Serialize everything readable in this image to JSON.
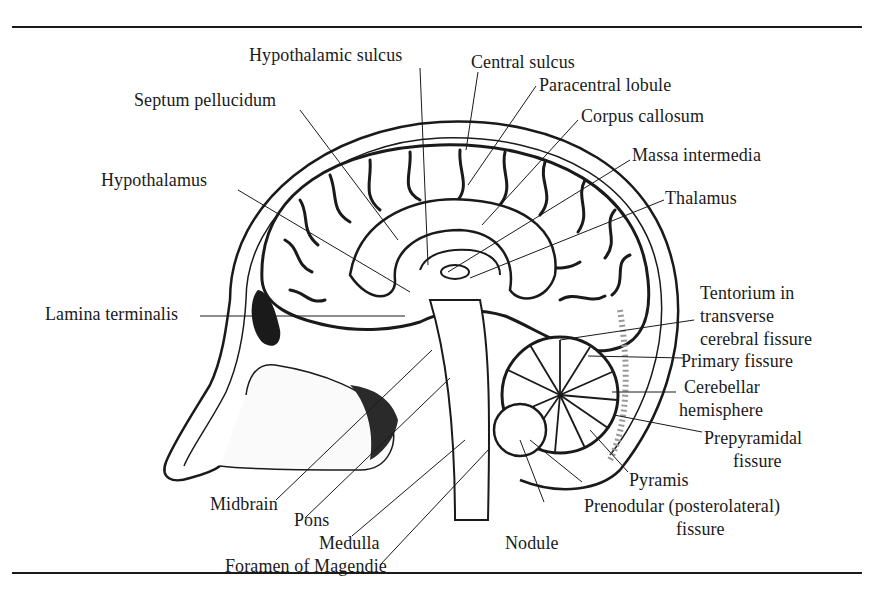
{
  "figure": {
    "labels": {
      "hypothalamic_sulcus": "Hypothalamic sulcus",
      "central_sulcus": "Central sulcus",
      "paracentral_lobule": "Paracentral lobule",
      "septum_pellucidum": "Septum pellucidum",
      "corpus_callosum": "Corpus callosum",
      "massa_intermedia": "Massa intermedia",
      "hypothalamus": "Hypothalamus",
      "thalamus": "Thalamus",
      "lamina_terminalis": "Lamina terminalis",
      "tentorium_line1": "Tentorium in",
      "tentorium_line2": "transverse",
      "tentorium_line3": "cerebral fissure",
      "primary_fissure": "Primary fissure",
      "cerebellar_line1": "Cerebellar",
      "cerebellar_line2": "hemisphere",
      "prepyramidal_line1": "Prepyramidal",
      "prepyramidal_line2": "fissure",
      "pyramis": "Pyramis",
      "midbrain": "Midbrain",
      "pons": "Pons",
      "medulla": "Medulla",
      "nodule": "Nodule",
      "prenodular_line1": "Prenodular (posterolateral)",
      "prenodular_line2": "fissure",
      "foramen_of_magendie": "Foramen of Magendie"
    },
    "colors": {
      "ink": "#1a1a1a",
      "paper": "#ffffff",
      "bone": "#f2f2f2",
      "shadow": "#2a2a2a"
    }
  }
}
